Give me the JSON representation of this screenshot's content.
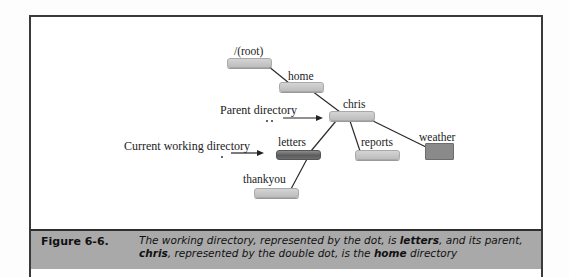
{
  "diagram": {
    "nodes": {
      "root": "/(root)",
      "home": "home",
      "chris": "chris",
      "letters": "letters",
      "reports": "reports",
      "weather": "weather",
      "thankyou": "thankyou"
    },
    "pointers": {
      "parent": {
        "label": "Parent directory",
        "symbol": ".."
      },
      "current": {
        "label": "Current working directory",
        "symbol": "."
      }
    },
    "edges": [
      [
        "root",
        "home"
      ],
      [
        "home",
        "chris"
      ],
      [
        "chris",
        "letters"
      ],
      [
        "chris",
        "reports"
      ],
      [
        "chris",
        "weather"
      ],
      [
        "letters",
        "thankyou"
      ]
    ],
    "colors": {
      "folder_light": "#c8c8c8",
      "folder_current": "#666666",
      "file_square": "#8a8a8a",
      "caption_bg": "#a9a9a9"
    }
  },
  "caption": {
    "figure_number": "Figure 6-6.",
    "line1_a": "The working directory, represented by the dot, is ",
    "line1_bold": "letters",
    "line1_b": ", and its parent,",
    "line2_bold1": "chris",
    "line2_a": ", represented by the double dot, is the ",
    "line2_bold2": "home",
    "line2_b": " directory"
  }
}
